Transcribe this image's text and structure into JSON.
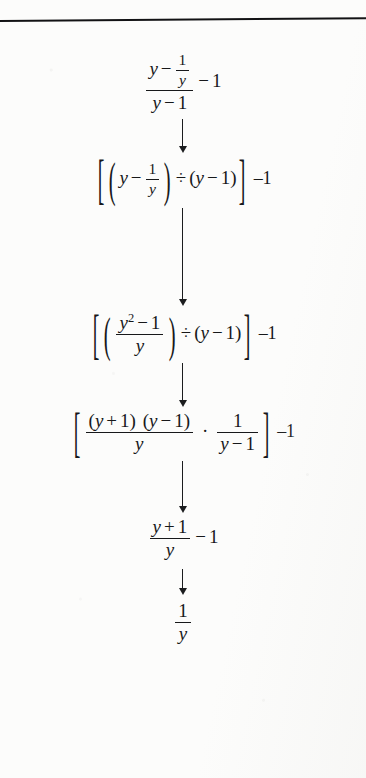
{
  "page": {
    "kind": "scanned-textbook-figure",
    "background_color": "#fcfcfb",
    "ink_color": "#17181a",
    "top_rule": true
  },
  "flow": {
    "title": "",
    "steps": [
      {
        "id": "step-1",
        "label": "original-complex-fraction",
        "notation": "(y - 1/y)/(y - 1) - 1",
        "parts": {
          "num_left": "y",
          "num_op": "−",
          "num_frac_num": "1",
          "num_frac_den": "y",
          "den_left": "y",
          "den_op": "−",
          "den_right": "1",
          "trailing_op": "−",
          "trailing_value": "1"
        }
      },
      {
        "id": "step-2",
        "label": "rewritten-as-division",
        "notation": "[(y - 1/y) ÷ (y - 1)] -1",
        "parts": {
          "open_bracket": "[",
          "open_paren": "(",
          "a_left": "y",
          "a_op": "−",
          "a_frac_num": "1",
          "a_frac_den": "y",
          "close_paren": ")",
          "divide": "÷",
          "b_open": "(",
          "b_left": "y",
          "b_op": "−",
          "b_right": "1",
          "b_close": ")",
          "close_bracket": "]",
          "outer": "–1"
        }
      },
      {
        "id": "step-3",
        "label": "numerator-combined",
        "notation": "[((y² - 1)/y) ÷ (y - 1)] -1",
        "parts": {
          "open_bracket": "[",
          "open_paren": "(",
          "frac_num_var": "y",
          "frac_num_exp": "2",
          "frac_num_op": "−",
          "frac_num_const": "1",
          "frac_den": "y",
          "close_paren": ")",
          "divide": "÷",
          "b_open": "(",
          "b_left": "y",
          "b_op": "−",
          "b_right": "1",
          "b_close": ")",
          "close_bracket": "]",
          "outer": "–1"
        }
      },
      {
        "id": "step-4",
        "label": "factored-and-inverted",
        "notation": "[((y + 1)(y - 1))/y · 1/(y - 1)] -1",
        "parts": {
          "open_bracket": "[",
          "f1_num_p1_open": "(",
          "f1_num_p1_left": "y",
          "f1_num_p1_op": "+",
          "f1_num_p1_right": "1",
          "f1_num_p1_close": ")",
          "f1_num_p2_open": "(",
          "f1_num_p2_left": "y",
          "f1_num_p2_op": "−",
          "f1_num_p2_right": "1",
          "f1_num_p2_close": ")",
          "f1_den": "y",
          "dot": "·",
          "f2_num": "1",
          "f2_den_left": "y",
          "f2_den_op": "−",
          "f2_den_right": "1",
          "close_bracket": "]",
          "outer": "–1"
        }
      },
      {
        "id": "step-5",
        "label": "simplified-fraction-minus-one",
        "notation": "(y + 1)/y - 1",
        "parts": {
          "num_left": "y",
          "num_op": "+",
          "num_right": "1",
          "den": "y",
          "trailing_op": "−",
          "trailing_value": "1"
        }
      },
      {
        "id": "step-6",
        "label": "final-result",
        "notation": "1/y",
        "parts": {
          "num": "1",
          "den": "y"
        }
      }
    ],
    "arrows": [
      {
        "id": "arrow-1",
        "from": "step-1",
        "to": "step-2",
        "length_px": 34
      },
      {
        "id": "arrow-2",
        "from": "step-2",
        "to": "step-3",
        "length_px": 98
      },
      {
        "id": "arrow-3",
        "from": "step-3",
        "to": "step-4",
        "length_px": 44
      },
      {
        "id": "arrow-4",
        "from": "step-4",
        "to": "step-5",
        "length_px": 52
      },
      {
        "id": "arrow-5",
        "from": "step-5",
        "to": "step-6",
        "length_px": 26
      }
    ]
  }
}
